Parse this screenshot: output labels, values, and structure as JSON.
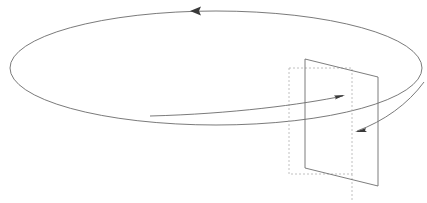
{
  "figure": {
    "background_color": "#ffffff",
    "width": 427,
    "height": 203
  },
  "colors": {
    "orbit_stroke": "#6b6b6b",
    "plane_stroke": "#6e6e6e",
    "dashed_stroke": "#b0b0b0",
    "arrowhead_fill": "#3a3a3a",
    "inner_arrow_stroke": "#6b6b6b"
  },
  "elements": {
    "orbit_ellipse": {
      "label": "closed loop path",
      "center_x": 216,
      "center_y": 68,
      "radius_x": 206,
      "radius_y": 57,
      "direction": "counterclockwise",
      "style": "solid"
    },
    "orbit_direction_arrowhead": {
      "label": "loop direction arrowhead",
      "tip_x": 190,
      "tip_y": 11,
      "points_toward": "left",
      "size": 11
    },
    "surface_plane": {
      "label": "surface bounded by the loop",
      "style": "solid",
      "corners": [
        {
          "x": 305,
          "y": 59
        },
        {
          "x": 378,
          "y": 77
        },
        {
          "x": 378,
          "y": 186
        },
        {
          "x": 305,
          "y": 168
        }
      ]
    },
    "reference_box": {
      "label": "hidden reference rectangle",
      "style": "dashed",
      "left": 289,
      "top": 68,
      "right": 352,
      "bottom": 174,
      "dash_pattern": "2 2"
    },
    "reference_box_stem": {
      "label": "dashed vertical stem below box",
      "x": 352,
      "y_start": 174,
      "y_end": 200
    },
    "normal_arrow": {
      "label": "arrow entering the surface",
      "tip_x": 345,
      "tip_y": 95,
      "start_x": 150,
      "start_y": 116,
      "style": "curved solid with arrowhead"
    },
    "exit_curve": {
      "label": "loop segment re-emerging at right of surface",
      "start_x": 357,
      "start_y": 131,
      "end_x": 424,
      "end_y": 82
    }
  },
  "annotations": []
}
